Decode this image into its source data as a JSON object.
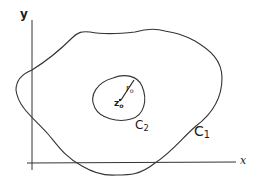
{
  "diagram": {
    "axes": {
      "x_label": "x",
      "y_label": "y"
    },
    "curves": {
      "outer": {
        "label": "C",
        "subscript": "1"
      },
      "inner": {
        "label": "C",
        "subscript": "2"
      }
    },
    "center": {
      "label": "z",
      "subscript": "o"
    },
    "radius": {
      "label": "r",
      "subscript": "o"
    },
    "colors": {
      "stroke": "#333333",
      "background": "#ffffff"
    }
  }
}
